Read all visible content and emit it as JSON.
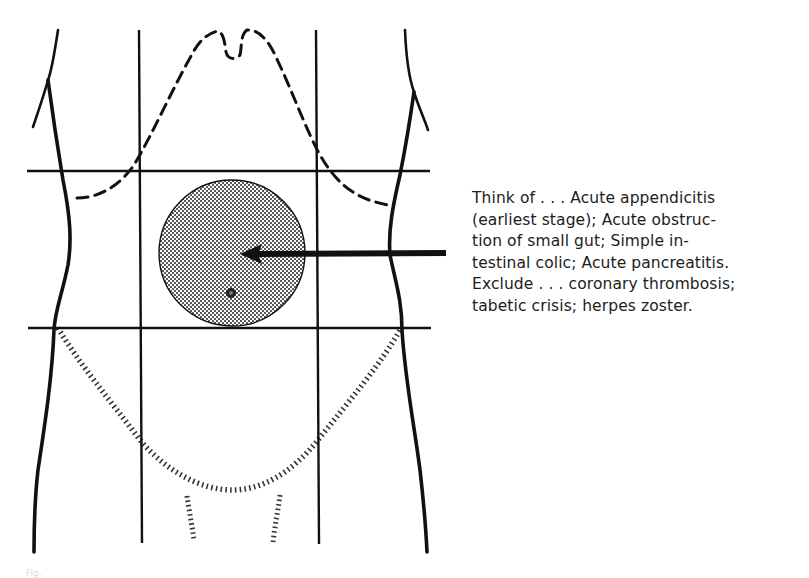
{
  "figure": {
    "type": "abdominal-region-diagram",
    "highlighted_region": "umbilical (central) region",
    "colors": {
      "ink": "#111111",
      "stipple_fill": "#b8b8b8",
      "background": "#ffffff"
    }
  },
  "annotation": {
    "lines": [
      "Think of . . . Acute appendicitis",
      "(earliest stage);  Acute obstruc-",
      "tion of small gut;  Simple in-",
      "testinal colic;  Acute pancreatitis.",
      "Exclude . . .  coronary thrombosis;",
      "tabetic crisis;  herpes zoster."
    ]
  },
  "caption": {
    "text": "Fig."
  }
}
